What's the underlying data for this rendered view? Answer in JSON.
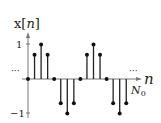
{
  "chart_data": {
    "type": "stem",
    "title": "",
    "ylabel": "x[n]",
    "xlabel": "n",
    "y_ticks": [
      "1",
      "-1"
    ],
    "ylim": [
      -1,
      1
    ],
    "annotations": [
      "...",
      "...",
      "N0"
    ],
    "n": [
      0,
      1,
      2,
      3,
      4,
      5,
      6,
      7,
      8,
      9,
      10,
      11,
      12,
      13,
      14,
      15
    ],
    "values": [
      0,
      0.7,
      1,
      0.7,
      0,
      -0.7,
      -1,
      -0.7,
      0,
      0.7,
      1,
      0.7,
      0,
      -0.7,
      -1,
      -0.7
    ],
    "period_marker_label": "N0"
  },
  "labels": {
    "ylabel_x": "x",
    "ylabel_bracket_open": "[",
    "ylabel_n": "n",
    "ylabel_bracket_close": "]",
    "tick_pos": "1",
    "tick_neg": "−1",
    "ellipsis_left": "···",
    "ellipsis_right": "···",
    "xlabel": "n",
    "period_N": "N",
    "period_sub": "0"
  }
}
